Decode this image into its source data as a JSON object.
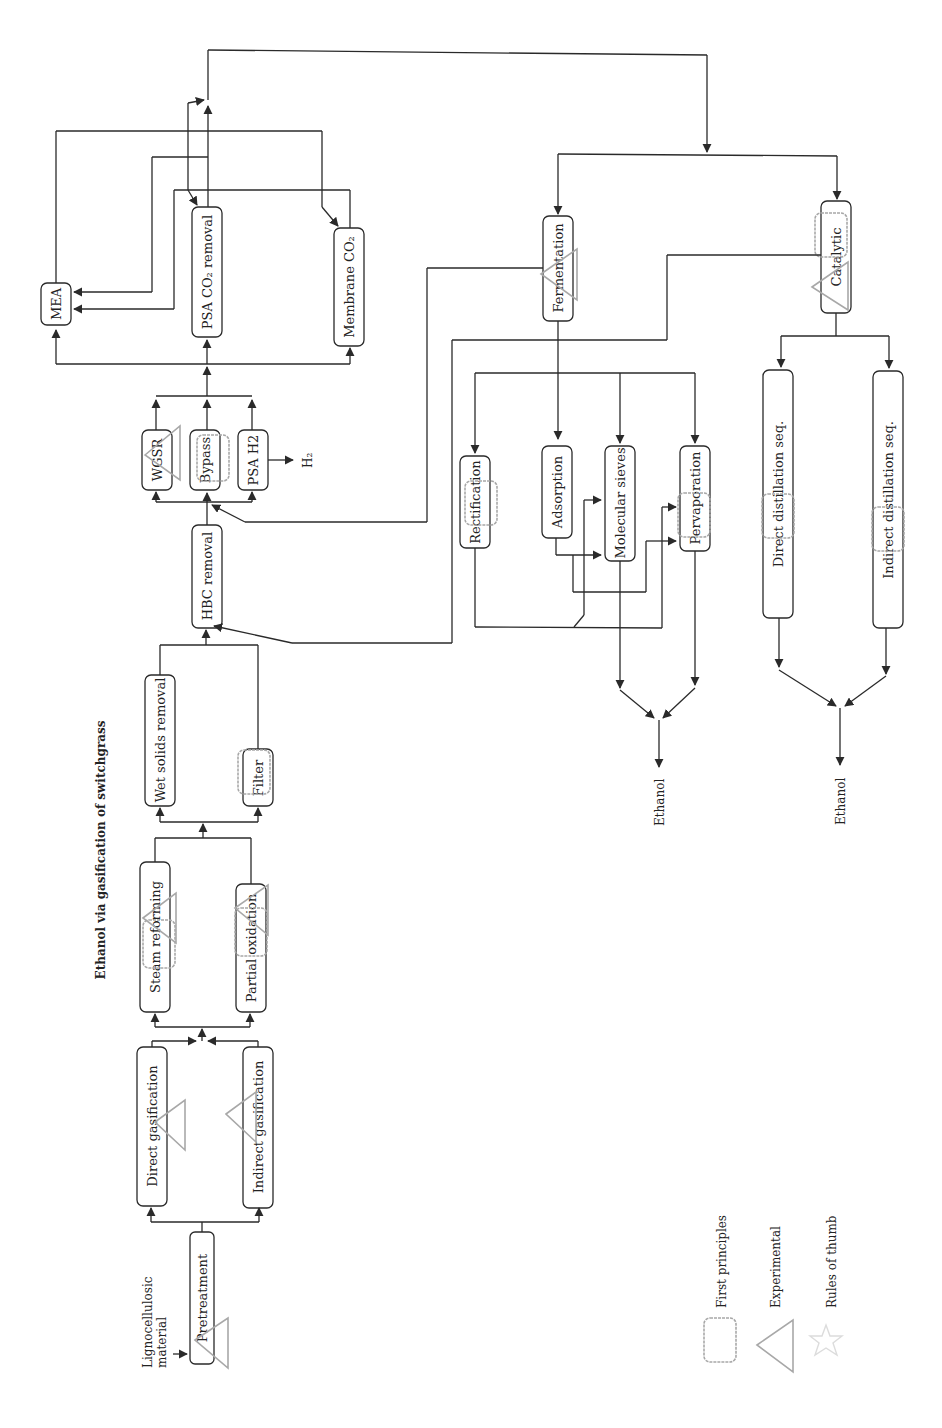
{
  "title": "Ethanol via gasification of switchgrass",
  "input_label_line1": "Lignocellulosic",
  "input_label_line2": "material",
  "nodes": {
    "pretreatment": "Pretreatment",
    "direct_gasification": "Direct gasification",
    "indirect_gasification": "Indirect gasification",
    "steam_reforming": "Steam reforming",
    "partial_oxidation": "Partial oxidation",
    "wet_solids_removal": "Wet solids removal",
    "filter": "Filter",
    "hbc_removal": "HBC removal",
    "wgsr": "WGSR",
    "bypass": "Bypass",
    "psa_h2": "PSA H2",
    "mea": "MEA",
    "psa_co2_removal": "PSA CO₂ removal",
    "membrane_co2": "Membrane CO₂",
    "fermentation": "Fermentation",
    "catalytic": "Catalytic",
    "rectification": "Rectification",
    "adsorption": "Adsorption",
    "molecular_sieves": "Molecular sieves",
    "pervaporation": "Pervaporation",
    "direct_distillation": "Direct distillation seq.",
    "indirect_distillation": "Indirect distillation seq."
  },
  "outputs": {
    "h2": "H₂",
    "ethanol_1": "Ethanol",
    "ethanol_2": "Ethanol"
  },
  "legend": {
    "first_principles": "First principles",
    "experimental": "Experimental",
    "rules_of_thumb": "Rules of thumb"
  },
  "colors": {
    "line": "#2a2a2a",
    "model_marker": "#a8a8a8",
    "rules_marker": "#dcdcdc"
  }
}
